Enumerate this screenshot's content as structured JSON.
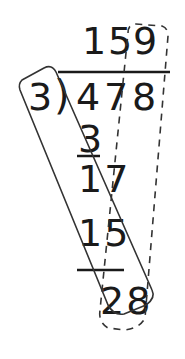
{
  "problem": {
    "dividend": "478",
    "divisor": "3",
    "quotient": "159",
    "bracket": ")"
  },
  "quotient_digits": [
    "1",
    "5",
    "9"
  ],
  "dividend_digits": [
    "4",
    "7",
    "8"
  ],
  "steps": [
    {
      "label": "subtract-1",
      "value": "3",
      "underlined": true
    },
    {
      "label": "remainder-bring-down-1",
      "value": "17",
      "underlined": false
    },
    {
      "label": "subtract-2",
      "value": "15",
      "underlined": true
    },
    {
      "label": "remainder-bring-down-2",
      "value": "28",
      "underlined": false
    }
  ],
  "annotations": {
    "solid_outline": "rounded rectangle enclosing the divisor path diagonally",
    "dashed_outline": "dashed tapered loop from quotient digit 9 down to 28"
  },
  "colors": {
    "ink": "#1a1a1a",
    "background": "#ffffff"
  }
}
